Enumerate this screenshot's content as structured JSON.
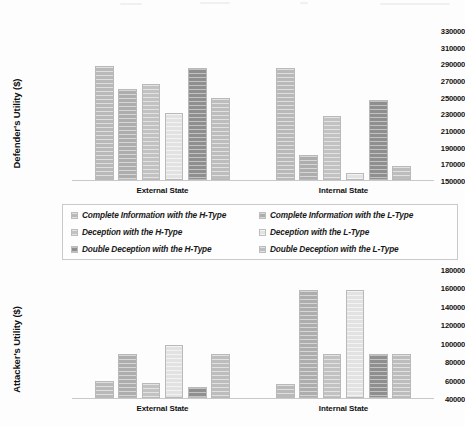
{
  "chart_data": [
    {
      "type": "bar",
      "title": "",
      "xlabel": "",
      "ylabel": "Defender's Utility ($)",
      "ylim": [
        150000,
        330000
      ],
      "ytick_step": 20000,
      "yticks": [
        "330000",
        "310000",
        "290000",
        "270000",
        "250000",
        "230000",
        "210000",
        "190000",
        "170000",
        "150000"
      ],
      "categories": [
        "External State",
        "Internal State"
      ],
      "grid": false,
      "legend_position": "below-chart-shared",
      "series": [
        {
          "name": "Complete Information with the H-Type",
          "values": [
            287000,
            284000
          ]
        },
        {
          "name": "Complete Information with the L-Type",
          "values": [
            259000,
            180000
          ]
        },
        {
          "name": "Deception with the H-Type",
          "values": [
            265000,
            227000
          ]
        },
        {
          "name": "Deception with the L-Type",
          "values": [
            230000,
            158000
          ]
        },
        {
          "name": "Double Deception with the H-Type",
          "values": [
            284000,
            246000
          ]
        },
        {
          "name": "Double Deception with the L-Type",
          "values": [
            248000,
            167000
          ]
        }
      ]
    },
    {
      "type": "bar",
      "title": "",
      "xlabel": "",
      "ylabel": "Attacker's Utility ($)",
      "ylim": [
        40000,
        180000
      ],
      "ytick_step": 20000,
      "yticks": [
        "180000",
        "160000",
        "140000",
        "120000",
        "100000",
        "80000",
        "60000",
        "40000"
      ],
      "categories": [
        "External State",
        "Internal State"
      ],
      "grid": false,
      "legend_position": "above-chart-shared",
      "series": [
        {
          "name": "Complete Information with the H-Type",
          "values": [
            58000,
            55000
          ]
        },
        {
          "name": "Complete Information with the L-Type",
          "values": [
            88000,
            157000
          ]
        },
        {
          "name": "Deception with the H-Type",
          "values": [
            56000,
            88000
          ]
        },
        {
          "name": "Deception with the L-Type",
          "values": [
            97000,
            157000
          ]
        },
        {
          "name": "Double Deception with the H-Type",
          "values": [
            52000,
            88000
          ]
        },
        {
          "name": "Double Deception with the L-Type",
          "values": [
            88000,
            88000
          ]
        }
      ]
    }
  ],
  "legend": {
    "entries": [
      {
        "label": "Complete Information with the H-Type",
        "color": "#b9b9b9"
      },
      {
        "label": "Complete Information with the L-Type",
        "color": "#adadad"
      },
      {
        "label": "Deception with the H-Type",
        "color": "#c2c2c2"
      },
      {
        "label": "Deception with the L-Type",
        "color": "#e2e2e2"
      },
      {
        "label": "Double Deception with the H-Type",
        "color": "#8f8f8f"
      },
      {
        "label": "Double Deception with the L-Type",
        "color": "#bdbdbd"
      }
    ]
  }
}
